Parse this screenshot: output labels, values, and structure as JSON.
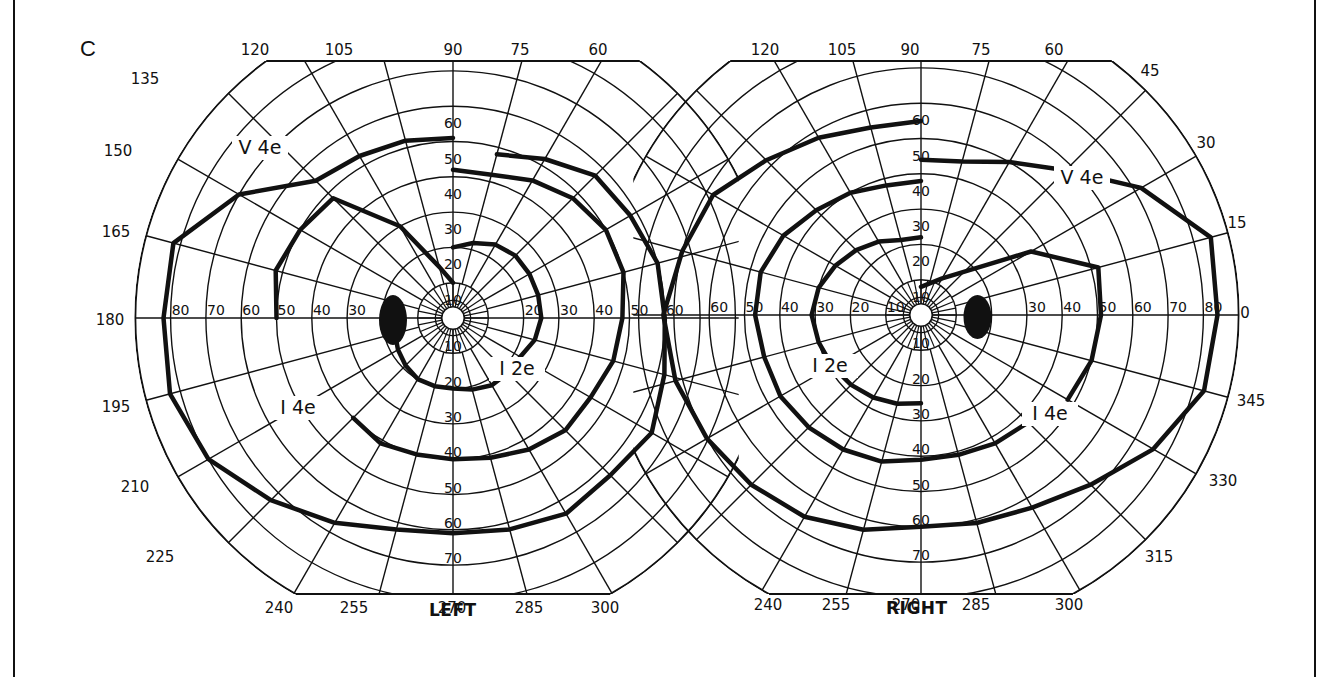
{
  "panel_label": "C",
  "chart_data": [
    {
      "type": "polar-perimetry",
      "title": "LEFT",
      "eye": "left",
      "center": [
        453,
        318
      ],
      "deg_per_ring_px": 35.3,
      "rings_deg": [
        10,
        20,
        30,
        40,
        50,
        60,
        70,
        80,
        90
      ],
      "meridian_labels": [
        "120",
        "105",
        "90",
        "75",
        "60",
        "135",
        "150",
        "165",
        "180",
        "195",
        "210",
        "225",
        "240",
        "255",
        "270",
        "285",
        "300"
      ],
      "horizontal_axis_labels": [
        "80",
        "70",
        "60",
        "50",
        "40",
        "30",
        "20",
        "20",
        "30",
        "40",
        "50",
        "60"
      ],
      "vertical_axis_labels_up": [
        "10",
        "20",
        "30",
        "40",
        "50",
        "60"
      ],
      "vertical_axis_labels_down": [
        "10",
        "20",
        "30",
        "40",
        "50",
        "60",
        "70"
      ],
      "isopters": [
        {
          "name": "V 4e",
          "label": "V 4e",
          "points": [
            [
              90,
              51
            ],
            [
              105,
              52
            ],
            [
              120,
              53
            ],
            [
              135,
              55
            ],
            [
              150,
              70
            ],
            [
              165,
              82
            ],
            [
              180,
              82
            ],
            [
              195,
              83
            ],
            [
              210,
              80
            ],
            [
              225,
              73
            ],
            [
              240,
              67
            ],
            [
              255,
              62
            ],
            [
              270,
              61
            ],
            [
              285,
              62
            ],
            [
              300,
              64
            ],
            [
              315,
              63
            ],
            [
              330,
              65
            ],
            [
              345,
              62
            ],
            [
              0,
              60
            ],
            [
              15,
              60
            ],
            [
              30,
              58
            ],
            [
              45,
              57
            ],
            [
              60,
              52
            ],
            [
              75,
              48
            ]
          ]
        },
        {
          "name": "I 4e",
          "label": "I 4e",
          "points": [
            [
              90,
              42
            ],
            [
              75,
              42
            ],
            [
              60,
              45
            ],
            [
              45,
              48
            ],
            [
              30,
              50
            ],
            [
              15,
              50
            ],
            [
              0,
              48
            ],
            [
              345,
              47
            ],
            [
              330,
              45
            ],
            [
              315,
              45
            ],
            [
              300,
              43
            ],
            [
              285,
              41
            ],
            [
              270,
              40
            ],
            [
              255,
              40
            ],
            [
              240,
              41
            ],
            [
              225,
              40
            ]
          ]
        },
        {
          "name": "I 4e upper",
          "label": "",
          "points": [
            [
              180,
              50
            ],
            [
              165,
              52
            ],
            [
              150,
              50
            ],
            [
              135,
              48
            ],
            [
              120,
              30
            ],
            [
              105,
              15
            ],
            [
              90,
              10
            ]
          ]
        },
        {
          "name": "I 2e",
          "label": "I 2e",
          "points": [
            [
              90,
              20
            ],
            [
              75,
              22
            ],
            [
              60,
              24
            ],
            [
              45,
              25
            ],
            [
              30,
              25
            ],
            [
              15,
              25
            ],
            [
              0,
              25
            ],
            [
              345,
              24
            ],
            [
              330,
              22
            ],
            [
              315,
              22
            ],
            [
              300,
              22
            ],
            [
              285,
              21
            ],
            [
              270,
              20
            ],
            [
              255,
              20
            ],
            [
              240,
              20
            ],
            [
              225,
              19
            ],
            [
              210,
              18
            ],
            [
              195,
              17
            ],
            [
              180,
              15
            ]
          ]
        }
      ],
      "blind_spot": {
        "angle_deg": 180,
        "ecc_deg": 17,
        "rx": 14,
        "ry": 25
      }
    },
    {
      "type": "polar-perimetry",
      "title": "RIGHT",
      "eye": "right",
      "center": [
        921,
        315
      ],
      "deg_per_ring_px": 35.3,
      "rings_deg": [
        10,
        20,
        30,
        40,
        50,
        60,
        70,
        80,
        90
      ],
      "meridian_labels": [
        "120",
        "105",
        "90",
        "75",
        "60",
        "45",
        "30",
        "15",
        "0",
        "345",
        "330",
        "315",
        "240",
        "255",
        "270",
        "285",
        "300"
      ],
      "horizontal_axis_labels": [
        "60",
        "50",
        "40",
        "30",
        "20",
        "10",
        "30",
        "40",
        "50",
        "60",
        "70",
        "80"
      ],
      "vertical_axis_labels_up": [
        "10",
        "20",
        "30",
        "40",
        "50",
        "60"
      ],
      "vertical_axis_labels_down": [
        "10",
        "20",
        "30",
        "40",
        "50",
        "60",
        "70"
      ],
      "isopters": [
        {
          "name": "V 4e",
          "label": "V 4e",
          "points": [
            [
              90,
              55
            ],
            [
              105,
              55
            ],
            [
              120,
              58
            ],
            [
              135,
              62
            ],
            [
              150,
              68
            ],
            [
              165,
              70
            ],
            [
              180,
              73
            ],
            [
              195,
              72
            ],
            [
              210,
              70
            ],
            [
              225,
              68
            ],
            [
              240,
              66
            ],
            [
              255,
              63
            ],
            [
              270,
              60
            ],
            [
              285,
              61
            ],
            [
              300,
              63
            ],
            [
              315,
              68
            ],
            [
              330,
              76
            ],
            [
              345,
              83
            ],
            [
              0,
              84
            ],
            [
              15,
              85
            ],
            [
              30,
              72
            ],
            [
              45,
              58
            ],
            [
              60,
              50
            ],
            [
              75,
              45
            ],
            [
              90,
              44
            ]
          ]
        },
        {
          "name": "I 4e",
          "label": "I 4e",
          "points": [
            [
              90,
              38
            ],
            [
              105,
              38
            ],
            [
              120,
              40
            ],
            [
              135,
              42
            ],
            [
              150,
              45
            ],
            [
              165,
              47
            ],
            [
              180,
              47
            ],
            [
              195,
              46
            ],
            [
              210,
              46
            ],
            [
              225,
              45
            ],
            [
              240,
              44
            ],
            [
              255,
              43
            ],
            [
              270,
              41
            ],
            [
              285,
              41
            ],
            [
              300,
              42
            ],
            [
              315,
              43
            ]
          ]
        },
        {
          "name": "I 4e temporal",
          "label": "",
          "points": [
            [
              330,
              48
            ],
            [
              345,
              50
            ],
            [
              0,
              51
            ],
            [
              15,
              52
            ],
            [
              30,
              36
            ],
            [
              60,
              12
            ],
            [
              90,
              8
            ]
          ]
        },
        {
          "name": "I 2e",
          "label": "I 2e",
          "points": [
            [
              90,
              22
            ],
            [
              105,
              22
            ],
            [
              120,
              24
            ],
            [
              135,
              26
            ],
            [
              150,
              28
            ],
            [
              165,
              30
            ],
            [
              180,
              31
            ],
            [
              195,
              30
            ],
            [
              210,
              29
            ],
            [
              225,
              28
            ],
            [
              240,
              27
            ],
            [
              255,
              26
            ],
            [
              270,
              25
            ]
          ]
        }
      ],
      "blind_spot": {
        "angle_deg": 0,
        "ecc_deg": 16,
        "rx": 14,
        "ry": 22
      }
    }
  ],
  "labels": {
    "left_eye": "LEFT",
    "right_eye": "RIGHT",
    "left_isopters": [
      "V 4e",
      "I 4e",
      "I 2e"
    ],
    "right_isopters": [
      "V 4e",
      "I 2e",
      "I 4e"
    ]
  }
}
